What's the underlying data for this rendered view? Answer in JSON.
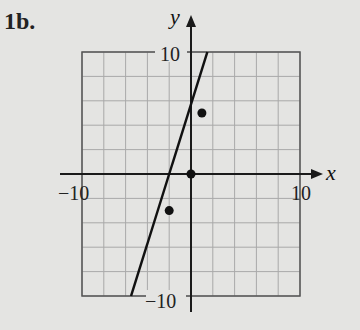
{
  "problem_label": "1b.",
  "chart_data": {
    "type": "scatter",
    "title": "",
    "xlabel": "x",
    "ylabel": "y",
    "xlim": [
      -10,
      10
    ],
    "ylim": [
      -10,
      10
    ],
    "grid": true,
    "grid_step": 2,
    "tick_labels": {
      "x_min": "−10",
      "x_max": "10",
      "y_min": "−10",
      "y_max": "10"
    },
    "points": [
      {
        "x": 1,
        "y": 5
      },
      {
        "x": 0,
        "y": 0
      },
      {
        "x": -2,
        "y": -3
      }
    ],
    "line": {
      "description": "fitted line",
      "slope": 3,
      "intercept": 6.5,
      "x_start": -5.5,
      "y_start": -10,
      "x_end": 1.5,
      "y_end": 10
    },
    "colors": {
      "background": "#e4e4e2",
      "grid": "#a9a9a9",
      "axis": "#1a1a1a",
      "line": "#111111",
      "points": "#111111"
    }
  }
}
